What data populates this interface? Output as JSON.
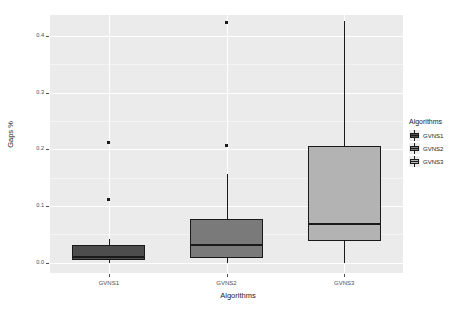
{
  "chart_data": {
    "type": "box",
    "title": "",
    "xlabel": "Algorithms",
    "ylabel": "Gaps %",
    "categories": [
      "GVNS1",
      "GVNS2",
      "GVNS3"
    ],
    "ylim": [
      -0.018,
      0.437
    ],
    "yticks": [
      0.0,
      0.1,
      0.2,
      0.3,
      0.4
    ],
    "ytick_labels": [
      "0.0",
      "0.1",
      "0.2",
      "0.3",
      "0.4"
    ],
    "grid": true,
    "legend": {
      "title": "Algorithms",
      "position": "right",
      "entries": [
        {
          "label": "GVNS1",
          "color": "#4d4d4d"
        },
        {
          "label": "GVNS2",
          "color": "#7a7a7a"
        },
        {
          "label": "GVNS3",
          "color": "#b3b3b3"
        }
      ]
    },
    "boxes": [
      {
        "name": "GVNS1",
        "color": "#4d4d4d",
        "lower_whisker": 0.0,
        "q1": 0.005,
        "median": 0.011,
        "q3": 0.032,
        "upper_whisker": 0.042,
        "outliers": [
          0.212,
          0.111
        ]
      },
      {
        "name": "GVNS2",
        "color": "#7a7a7a",
        "lower_whisker": 0.0,
        "q1": 0.008,
        "median": 0.032,
        "q3": 0.078,
        "upper_whisker": 0.157,
        "outliers": [
          0.423,
          0.206
        ]
      },
      {
        "name": "GVNS3",
        "color": "#b3b3b3",
        "lower_whisker": 0.0,
        "q1": 0.038,
        "median": 0.068,
        "q3": 0.206,
        "upper_whisker": 0.427,
        "outliers": []
      }
    ]
  },
  "panel": {
    "background": "#ebebeb",
    "gridline_color": "#ffffff"
  }
}
